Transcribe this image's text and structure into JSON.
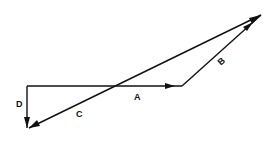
{
  "diagram": {
    "type": "vector-addition",
    "colors": {
      "ink": "#111111",
      "background": "#ffffff"
    },
    "vectors": [
      {
        "id": "A",
        "label": "A",
        "from": [
          27,
          86
        ],
        "to": [
          182,
          86
        ]
      },
      {
        "id": "B",
        "label": "B",
        "from": [
          182,
          86
        ],
        "to": [
          261,
          15
        ]
      },
      {
        "id": "C",
        "label": "C",
        "from": [
          261,
          15
        ],
        "to": [
          28,
          128
        ]
      },
      {
        "id": "D",
        "label": "D",
        "from": [
          27,
          86
        ],
        "to": [
          27,
          128
        ]
      }
    ],
    "labels": {
      "A": "A",
      "B": "B",
      "C": "C",
      "D": "D"
    }
  }
}
